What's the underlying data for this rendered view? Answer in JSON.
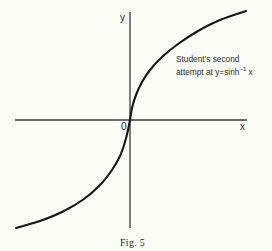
{
  "figure": {
    "caption": "Fig. 5",
    "axes": {
      "x_label": "x",
      "y_label": "y",
      "origin_label": "0"
    },
    "annotation": {
      "line1": "Student's second",
      "line2_prefix": "attempt at y=sinh",
      "line2_superscript": "−1",
      "line2_suffix": " x"
    },
    "curve": {
      "description": "Sketch through the origin with vertical tangent at 0, increasing and concave-down for x>0, concave-up for x<0",
      "passes_through_origin": true
    }
  }
}
